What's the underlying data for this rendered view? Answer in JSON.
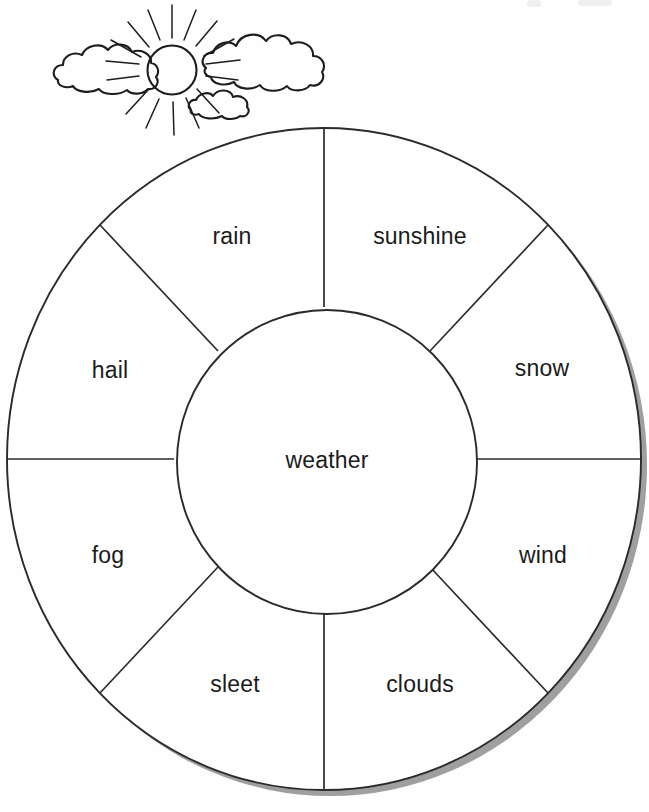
{
  "page": {
    "background_color": "#fefefe",
    "ink_color": "#2b2b2b",
    "shadow_color": "#9a9a9a",
    "width": 649,
    "height": 812
  },
  "illustration": {
    "name": "sun-and-clouds-illustration",
    "depicts": "sun with rays and three clouds",
    "sun": {
      "cx": 172,
      "cy": 70,
      "r": 24,
      "ray_count": 16
    },
    "clouds": [
      {
        "name": "cloud-left",
        "cx": 103,
        "cy": 78
      },
      {
        "name": "cloud-right",
        "cx": 252,
        "cy": 66
      },
      {
        "name": "cloud-small-bottom",
        "cx": 215,
        "cy": 108
      }
    ]
  },
  "wheel": {
    "name": "weather-word-wheel",
    "center": {
      "x": 324,
      "y": 459
    },
    "outer_radius_x": 317,
    "outer_radius_y": 331,
    "inner_radius_x": 150,
    "inner_radius_y": 152,
    "segment_count": 8,
    "hub": {
      "label": "weather",
      "label_x": 327,
      "label_y": 462
    },
    "segments": [
      {
        "id": "sunshine",
        "label": "sunshine",
        "label_x": 420,
        "label_y": 238,
        "start_deg": -90,
        "end_deg": -45
      },
      {
        "id": "snow",
        "label": "snow",
        "label_x": 542,
        "label_y": 370,
        "start_deg": -45,
        "end_deg": 0
      },
      {
        "id": "wind",
        "label": "wind",
        "label_x": 543,
        "label_y": 557,
        "start_deg": 0,
        "end_deg": 45
      },
      {
        "id": "clouds",
        "label": "clouds",
        "label_x": 420,
        "label_y": 686,
        "start_deg": 45,
        "end_deg": 90
      },
      {
        "id": "sleet",
        "label": "sleet",
        "label_x": 235,
        "label_y": 686,
        "start_deg": 90,
        "end_deg": 135
      },
      {
        "id": "fog",
        "label": "fog",
        "label_x": 108,
        "label_y": 557,
        "start_deg": 135,
        "end_deg": 180
      },
      {
        "id": "hail",
        "label": "hail",
        "label_x": 110,
        "label_y": 372,
        "start_deg": 180,
        "end_deg": 225
      },
      {
        "id": "rain",
        "label": "rain",
        "label_x": 232,
        "label_y": 238,
        "start_deg": 225,
        "end_deg": 270
      }
    ]
  }
}
